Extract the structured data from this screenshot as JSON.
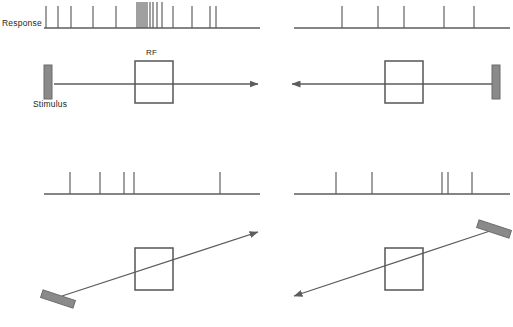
{
  "figure": {
    "type": "neural-response-raster-stimulus-diagram",
    "background": "#ffffff",
    "ink_color": "#5a5a5a",
    "text_color": "#231f20",
    "bar_fill": "#8a8a8a",
    "bar_stroke": "#6b6b6b",
    "rf_stroke": "#555555",
    "axis_color": "#5d5d5d"
  },
  "labels": {
    "response": "Response",
    "stimulus": "Stimulus",
    "rf": "RF"
  },
  "chart_data": {
    "type": "raster",
    "title": "",
    "xlabel": "",
    "ylabel": "",
    "panels": [
      {
        "id": "top-left",
        "raster": {
          "baseline_x": [
            44,
            260
          ],
          "spike_count": 19,
          "spike_times": [
            46,
            58,
            71,
            93,
            116,
            137,
            139,
            141,
            143,
            145,
            147,
            150,
            153,
            157,
            162,
            173,
            192,
            210,
            216
          ],
          "tick_heights": [
            22,
            22,
            22,
            22,
            22,
            26,
            26,
            26,
            26,
            26,
            26,
            26,
            26,
            26,
            26,
            22,
            22,
            22,
            22
          ]
        },
        "stimulus": {
          "motion": "rightward-horizontal",
          "arrow_from": [
            54,
            84
          ],
          "arrow_to": [
            258,
            84
          ],
          "bar_center": [
            48,
            82
          ],
          "bar_angle_deg": 0,
          "rf_box": {
            "x": 135,
            "y": 61,
            "w": 38,
            "h": 42
          },
          "rf_label_pos": [
            147,
            50
          ],
          "show_response_label": true,
          "show_stimulus_label": true
        }
      },
      {
        "id": "top-right",
        "raster": {
          "baseline_x": [
            294,
            510
          ],
          "spike_count": 5,
          "spike_times": [
            342,
            378,
            404,
            444,
            474
          ],
          "tick_heights": [
            22,
            22,
            22,
            22,
            22
          ]
        },
        "stimulus": {
          "motion": "leftward-horizontal",
          "arrow_from": [
            498,
            84
          ],
          "arrow_to": [
            292,
            84
          ],
          "bar_center": [
            496,
            82
          ],
          "bar_angle_deg": 0,
          "rf_box": {
            "x": 385,
            "y": 61,
            "w": 38,
            "h": 42
          },
          "rf_label_pos": null,
          "show_response_label": false,
          "show_stimulus_label": false
        }
      },
      {
        "id": "bottom-left",
        "raster": {
          "baseline_x": [
            44,
            260
          ],
          "spike_count": 5,
          "spike_times": [
            70,
            100,
            124,
            134,
            220
          ],
          "tick_heights": [
            22,
            22,
            22,
            22,
            22
          ]
        },
        "stimulus": {
          "motion": "diagonal-up-right",
          "arrow_from": [
            62,
            296
          ],
          "arrow_to": [
            258,
            232
          ],
          "bar_center": [
            58,
            299
          ],
          "bar_angle_deg": -72,
          "rf_box": {
            "x": 135,
            "y": 248,
            "w": 38,
            "h": 42
          },
          "rf_label_pos": null,
          "show_response_label": false,
          "show_stimulus_label": false
        }
      },
      {
        "id": "bottom-right",
        "raster": {
          "baseline_x": [
            294,
            510
          ],
          "spike_count": 5,
          "spike_times": [
            336,
            372,
            442,
            448,
            472
          ],
          "tick_heights": [
            22,
            22,
            22,
            22,
            22
          ]
        },
        "stimulus": {
          "motion": "diagonal-down-left",
          "arrow_from": [
            490,
            231
          ],
          "arrow_to": [
            294,
            296
          ],
          "bar_center": [
            494,
            229
          ],
          "bar_angle_deg": -72,
          "rf_box": {
            "x": 385,
            "y": 248,
            "w": 38,
            "h": 42
          },
          "rf_label_pos": null,
          "show_response_label": false,
          "show_stimulus_label": false
        }
      }
    ]
  }
}
